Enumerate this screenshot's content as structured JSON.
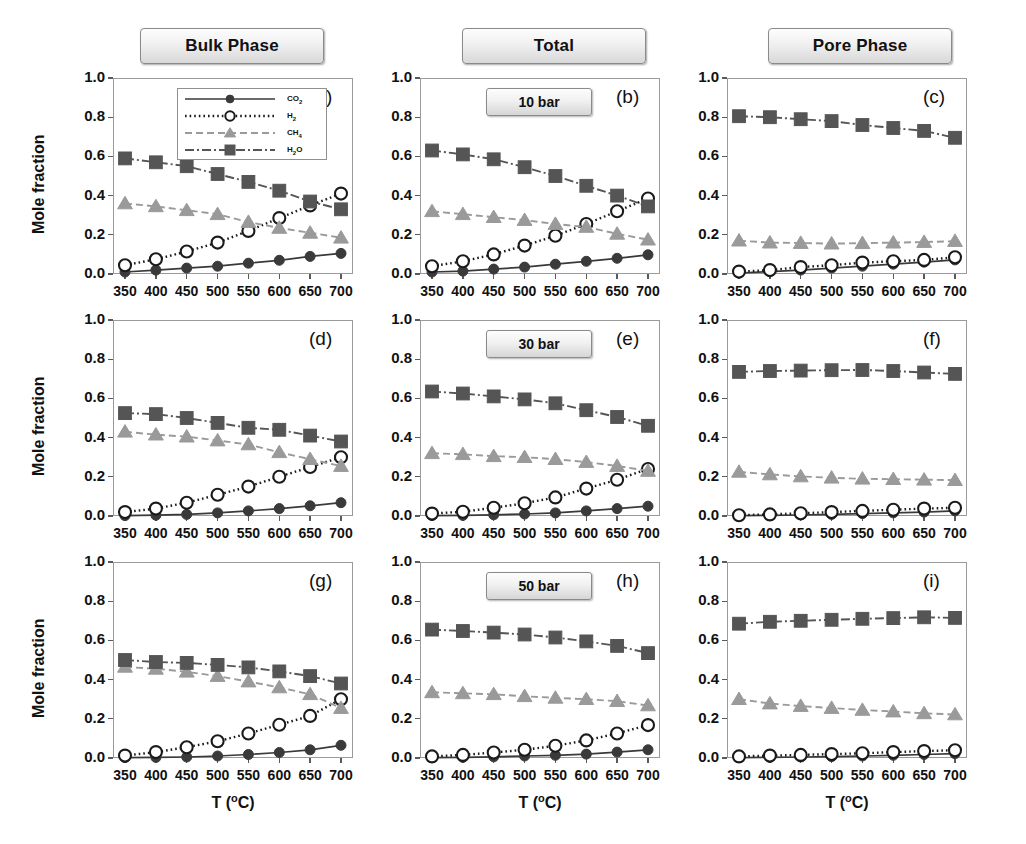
{
  "figure": {
    "column_headers": [
      "Bulk Phase",
      "Total",
      "Pore Phase"
    ],
    "y_axis_label": "Mole fraction",
    "x_axis_label": "T (°C)",
    "pressure_labels": [
      "10 bar",
      "30 bar",
      "50 bar"
    ],
    "panel_tags": [
      "(a)",
      "(b)",
      "(c)",
      "(d)",
      "(e)",
      "(f)",
      "(g)",
      "(h)",
      "(i)"
    ],
    "y_ticks": [
      "0.0",
      "0.2",
      "0.4",
      "0.6",
      "0.8",
      "1.0"
    ],
    "x_ticks": [
      "350",
      "400",
      "450",
      "500",
      "550",
      "600",
      "650",
      "700"
    ],
    "legend": {
      "entries": [
        {
          "label": "CO2",
          "html": "CO<sub>2</sub>",
          "style": "solid",
          "marker": "filled-circle",
          "color": "#3a3a3a"
        },
        {
          "label": "H2",
          "html": "H<sub>2</sub>",
          "style": "dotted",
          "marker": "open-circle",
          "color": "#1a1a1a"
        },
        {
          "label": "CH4",
          "html": "CH<sub>4</sub>",
          "style": "dashed",
          "marker": "filled-triangle",
          "color": "#9a9a9a"
        },
        {
          "label": "H2O",
          "html": "H<sub>2</sub>O",
          "style": "dashdot",
          "marker": "filled-square",
          "color": "#555555"
        }
      ]
    },
    "colors": {
      "co2": "#3a3a3a",
      "h2": "#1a1a1a",
      "ch4": "#9a9a9a",
      "h2o": "#555555",
      "axis": "#9a9a9a",
      "text": "#111111"
    }
  },
  "chart_data": [
    {
      "type": "line",
      "panel": "(a)",
      "title": "Bulk Phase – 10 bar",
      "xlabel": "T (°C)",
      "ylabel": "Mole fraction",
      "xlim": [
        330,
        720
      ],
      "ylim": [
        0.0,
        1.0
      ],
      "grid": false,
      "x": [
        350,
        400,
        450,
        500,
        550,
        600,
        650,
        700
      ],
      "series": [
        {
          "name": "CO2",
          "values": [
            0.01,
            0.02,
            0.03,
            0.04,
            0.055,
            0.07,
            0.09,
            0.105
          ]
        },
        {
          "name": "H2",
          "values": [
            0.045,
            0.075,
            0.115,
            0.16,
            0.22,
            0.285,
            0.35,
            0.41
          ]
        },
        {
          "name": "CH4",
          "values": [
            0.36,
            0.345,
            0.325,
            0.305,
            0.265,
            0.235,
            0.21,
            0.185
          ]
        },
        {
          "name": "H2O",
          "values": [
            0.59,
            0.57,
            0.55,
            0.51,
            0.47,
            0.425,
            0.37,
            0.33
          ]
        }
      ]
    },
    {
      "type": "line",
      "panel": "(b)",
      "title": "Total – 10 bar",
      "xlabel": "T (°C)",
      "ylabel": "Mole fraction",
      "xlim": [
        330,
        720
      ],
      "ylim": [
        0.0,
        1.0
      ],
      "grid": false,
      "x": [
        350,
        400,
        450,
        500,
        550,
        600,
        650,
        700
      ],
      "series": [
        {
          "name": "CO2",
          "values": [
            0.01,
            0.015,
            0.025,
            0.035,
            0.05,
            0.065,
            0.08,
            0.098
          ]
        },
        {
          "name": "H2",
          "values": [
            0.04,
            0.065,
            0.1,
            0.145,
            0.195,
            0.255,
            0.32,
            0.385
          ]
        },
        {
          "name": "CH4",
          "values": [
            0.32,
            0.305,
            0.29,
            0.275,
            0.255,
            0.24,
            0.205,
            0.175
          ]
        },
        {
          "name": "H2O",
          "values": [
            0.63,
            0.61,
            0.585,
            0.545,
            0.5,
            0.45,
            0.4,
            0.345
          ]
        }
      ]
    },
    {
      "type": "line",
      "panel": "(c)",
      "title": "Pore Phase – 10 bar",
      "xlabel": "T (°C)",
      "ylabel": "Mole fraction",
      "xlim": [
        330,
        720
      ],
      "ylim": [
        0.0,
        1.0
      ],
      "grid": false,
      "x": [
        350,
        400,
        450,
        500,
        550,
        600,
        650,
        700
      ],
      "series": [
        {
          "name": "CO2",
          "values": [
            0.005,
            0.012,
            0.02,
            0.03,
            0.04,
            0.05,
            0.06,
            0.072
          ]
        },
        {
          "name": "H2",
          "values": [
            0.012,
            0.02,
            0.035,
            0.045,
            0.058,
            0.065,
            0.072,
            0.085
          ]
        },
        {
          "name": "CH4",
          "values": [
            0.17,
            0.16,
            0.158,
            0.155,
            0.157,
            0.16,
            0.163,
            0.168
          ]
        },
        {
          "name": "H2O",
          "values": [
            0.805,
            0.8,
            0.79,
            0.78,
            0.76,
            0.745,
            0.73,
            0.695
          ]
        }
      ]
    },
    {
      "type": "line",
      "panel": "(d)",
      "title": "Bulk Phase – 30 bar",
      "xlabel": "T (°C)",
      "ylabel": "Mole fraction",
      "xlim": [
        330,
        720
      ],
      "ylim": [
        0.0,
        1.0
      ],
      "grid": false,
      "x": [
        350,
        400,
        450,
        500,
        550,
        600,
        650,
        700
      ],
      "series": [
        {
          "name": "CO2",
          "values": [
            0.002,
            0.004,
            0.008,
            0.016,
            0.026,
            0.038,
            0.052,
            0.068
          ]
        },
        {
          "name": "H2",
          "values": [
            0.02,
            0.038,
            0.068,
            0.108,
            0.15,
            0.2,
            0.25,
            0.3
          ]
        },
        {
          "name": "CH4",
          "values": [
            0.43,
            0.415,
            0.405,
            0.385,
            0.365,
            0.325,
            0.29,
            0.255
          ]
        },
        {
          "name": "H2O",
          "values": [
            0.525,
            0.52,
            0.5,
            0.475,
            0.45,
            0.44,
            0.41,
            0.38
          ]
        }
      ]
    },
    {
      "type": "line",
      "panel": "(e)",
      "title": "Total – 30 bar",
      "xlabel": "T (°C)",
      "ylabel": "Mole fraction",
      "xlim": [
        330,
        720
      ],
      "ylim": [
        0.0,
        1.0
      ],
      "grid": false,
      "x": [
        350,
        400,
        450,
        500,
        550,
        600,
        650,
        700
      ],
      "series": [
        {
          "name": "CO2",
          "values": [
            0.002,
            0.003,
            0.006,
            0.01,
            0.016,
            0.026,
            0.038,
            0.05
          ]
        },
        {
          "name": "H2",
          "values": [
            0.012,
            0.022,
            0.042,
            0.065,
            0.095,
            0.14,
            0.185,
            0.24
          ]
        },
        {
          "name": "CH4",
          "values": [
            0.32,
            0.315,
            0.305,
            0.3,
            0.29,
            0.275,
            0.255,
            0.23
          ]
        },
        {
          "name": "H2O",
          "values": [
            0.635,
            0.625,
            0.61,
            0.595,
            0.575,
            0.54,
            0.505,
            0.46
          ]
        }
      ]
    },
    {
      "type": "line",
      "panel": "(f)",
      "title": "Pore Phase – 30 bar",
      "xlabel": "T (°C)",
      "ylabel": "Mole fraction",
      "xlim": [
        330,
        720
      ],
      "ylim": [
        0.0,
        1.0
      ],
      "grid": false,
      "x": [
        350,
        400,
        450,
        500,
        550,
        600,
        650,
        700
      ],
      "series": [
        {
          "name": "CO2",
          "values": [
            0.002,
            0.003,
            0.005,
            0.008,
            0.012,
            0.016,
            0.02,
            0.026
          ]
        },
        {
          "name": "H2",
          "values": [
            0.004,
            0.008,
            0.014,
            0.02,
            0.026,
            0.032,
            0.038,
            0.042
          ]
        },
        {
          "name": "CH4",
          "values": [
            0.225,
            0.212,
            0.202,
            0.195,
            0.19,
            0.188,
            0.185,
            0.183
          ]
        },
        {
          "name": "H2O",
          "values": [
            0.735,
            0.74,
            0.742,
            0.744,
            0.745,
            0.74,
            0.732,
            0.725
          ]
        }
      ]
    },
    {
      "type": "line",
      "panel": "(g)",
      "title": "Bulk Phase – 50 bar",
      "xlabel": "T (°C)",
      "ylabel": "Mole fraction",
      "xlim": [
        330,
        720
      ],
      "ylim": [
        0.0,
        1.0
      ],
      "grid": false,
      "x": [
        350,
        400,
        450,
        500,
        550,
        600,
        650,
        700
      ],
      "series": [
        {
          "name": "CO2",
          "values": [
            0.002,
            0.003,
            0.005,
            0.01,
            0.018,
            0.028,
            0.042,
            0.065
          ]
        },
        {
          "name": "H2",
          "values": [
            0.012,
            0.03,
            0.055,
            0.085,
            0.125,
            0.17,
            0.215,
            0.3
          ]
        },
        {
          "name": "CH4",
          "values": [
            0.465,
            0.455,
            0.44,
            0.418,
            0.39,
            0.36,
            0.325,
            0.255
          ]
        },
        {
          "name": "H2O",
          "values": [
            0.5,
            0.49,
            0.485,
            0.475,
            0.462,
            0.442,
            0.418,
            0.38
          ]
        }
      ]
    },
    {
      "type": "line",
      "panel": "(h)",
      "title": "Total – 50 bar",
      "xlabel": "T (°C)",
      "ylabel": "Mole fraction",
      "xlim": [
        330,
        720
      ],
      "ylim": [
        0.0,
        1.0
      ],
      "grid": false,
      "x": [
        350,
        400,
        450,
        500,
        550,
        600,
        650,
        700
      ],
      "series": [
        {
          "name": "CO2",
          "values": [
            0.002,
            0.003,
            0.006,
            0.01,
            0.014,
            0.02,
            0.03,
            0.042
          ]
        },
        {
          "name": "H2",
          "values": [
            0.008,
            0.016,
            0.028,
            0.042,
            0.062,
            0.09,
            0.125,
            0.168
          ]
        },
        {
          "name": "CH4",
          "values": [
            0.335,
            0.33,
            0.325,
            0.315,
            0.307,
            0.3,
            0.29,
            0.268
          ]
        },
        {
          "name": "H2O",
          "values": [
            0.655,
            0.648,
            0.64,
            0.63,
            0.615,
            0.595,
            0.572,
            0.535
          ]
        }
      ]
    },
    {
      "type": "line",
      "panel": "(i)",
      "title": "Pore Phase – 50 bar",
      "xlabel": "T (°C)",
      "ylabel": "Mole fraction",
      "xlim": [
        330,
        720
      ],
      "ylim": [
        0.0,
        1.0
      ],
      "grid": false,
      "x": [
        350,
        400,
        450,
        500,
        550,
        600,
        650,
        700
      ],
      "series": [
        {
          "name": "CO2",
          "values": [
            0.002,
            0.003,
            0.005,
            0.007,
            0.01,
            0.014,
            0.018,
            0.022
          ]
        },
        {
          "name": "H2",
          "values": [
            0.008,
            0.012,
            0.016,
            0.02,
            0.024,
            0.03,
            0.035,
            0.04
          ]
        },
        {
          "name": "CH4",
          "values": [
            0.3,
            0.278,
            0.265,
            0.255,
            0.245,
            0.237,
            0.228,
            0.222
          ]
        },
        {
          "name": "H2O",
          "values": [
            0.685,
            0.695,
            0.7,
            0.705,
            0.71,
            0.714,
            0.718,
            0.715
          ]
        }
      ]
    }
  ]
}
